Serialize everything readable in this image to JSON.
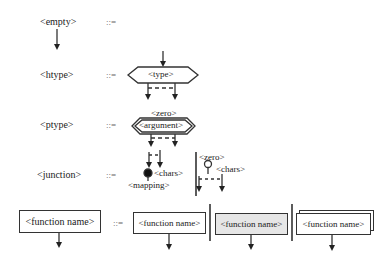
{
  "rules": [
    {
      "lhs": "<empty>",
      "op": "::="
    },
    {
      "lhs": "<htype>",
      "op": "::=",
      "rhs": {
        "shape": "hexagon",
        "label": "<type>"
      }
    },
    {
      "lhs": "<ptype>",
      "op": "::=",
      "rhs": {
        "shape": "double-hexagon",
        "label": "<argument>",
        "above": "<zero>"
      }
    },
    {
      "lhs": "<junction>",
      "op": "::=",
      "rhs": {
        "alt1": {
          "node": "filled-circle",
          "right": "<chars>",
          "below": "<mapping>"
        },
        "alt2": {
          "node": "open-circle",
          "above": "<zero>",
          "right": "<chars>"
        }
      }
    },
    {
      "lhs": "<function name>",
      "op": "::=",
      "rhs": [
        {
          "shape": "box",
          "label": "<function name>"
        },
        {
          "shape": "shaded-box",
          "label": "<function name>"
        },
        {
          "shape": "stacked-box",
          "label": "<function name>"
        }
      ]
    }
  ],
  "colors": {
    "line": "#333333",
    "shade": "#e6e6e6",
    "op": "#666666"
  }
}
